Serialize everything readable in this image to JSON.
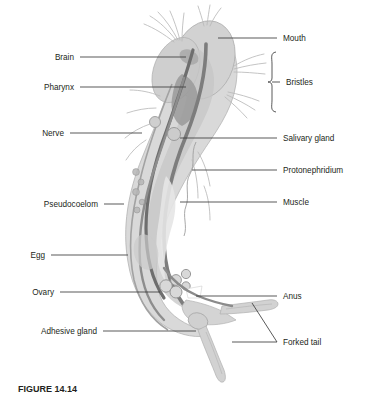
{
  "figure": {
    "caption": "FIGURE 14.14",
    "background_color": "#ffffff",
    "label_text_color": "#231f20",
    "leader_line_color": "#3b3b3b",
    "body_fill_color": "#d5d5d5",
    "body_outline_color": "#b0b0b0",
    "organ_dark_color": "#8a8a8a",
    "organ_darker_color": "#6f6f6f"
  },
  "labels_left": [
    {
      "text": "Brain",
      "text_x": 74,
      "text_y": 60,
      "line_x1": 80,
      "line_x2": 186,
      "line_y": 57
    },
    {
      "text": "Pharynx",
      "text_x": 74,
      "text_y": 90,
      "line_x1": 80,
      "line_x2": 186,
      "line_y": 87
    },
    {
      "text": "Nerve",
      "text_x": 64,
      "text_y": 136,
      "line_x1": 70,
      "line_x2": 142,
      "line_y": 133
    },
    {
      "text": "Pseudocoelom",
      "text_x": 98,
      "text_y": 207,
      "line_x1": 104,
      "line_x2": 124,
      "line_y": 204
    },
    {
      "text": "Egg",
      "text_x": 45,
      "text_y": 258,
      "line_x1": 51,
      "line_x2": 128,
      "line_y": 255
    },
    {
      "text": "Ovary",
      "text_x": 54,
      "text_y": 295,
      "line_x1": 60,
      "line_x2": 160,
      "line_y": 292
    },
    {
      "text": "Adhesive gland",
      "text_x": 97,
      "text_y": 334,
      "line_x1": 103,
      "line_x2": 196,
      "line_y": 331
    }
  ],
  "labels_right": [
    {
      "text": "Mouth",
      "text_x": 283,
      "text_y": 41,
      "line_x1": 218,
      "line_x2": 277,
      "line_y": 38
    },
    {
      "text": "Bristles",
      "text_x": 292,
      "text_y": 85,
      "line_x1": 278,
      "line_x2": 286,
      "line_y": 82
    },
    {
      "text": "Salivary gland",
      "text_x": 283,
      "text_y": 141,
      "line_x1": 186,
      "line_x2": 277,
      "line_y": 138
    },
    {
      "text": "Protonephridium",
      "text_x": 283,
      "text_y": 173,
      "line_x1": 196,
      "line_x2": 277,
      "line_y": 170
    },
    {
      "text": "Muscle",
      "text_x": 283,
      "text_y": 205,
      "line_x1": 186,
      "line_x2": 277,
      "line_y": 202
    },
    {
      "text": "Anus",
      "text_x": 283,
      "text_y": 299,
      "line_x1": 196,
      "line_x2": 277,
      "line_y": 296
    },
    {
      "text": "Forked tail",
      "text_x": 283,
      "text_y": 345,
      "line_x1": 232,
      "line_x2": 277,
      "line_y": 342
    }
  ],
  "bristles_brace": {
    "x": 272,
    "top_y": 52,
    "bottom_y": 112,
    "tick_y": 82,
    "tick_x": 280
  },
  "forked_tail_extra_leader": {
    "from_x": 277,
    "from_y": 342,
    "to_x": 252,
    "to_y": 303
  }
}
